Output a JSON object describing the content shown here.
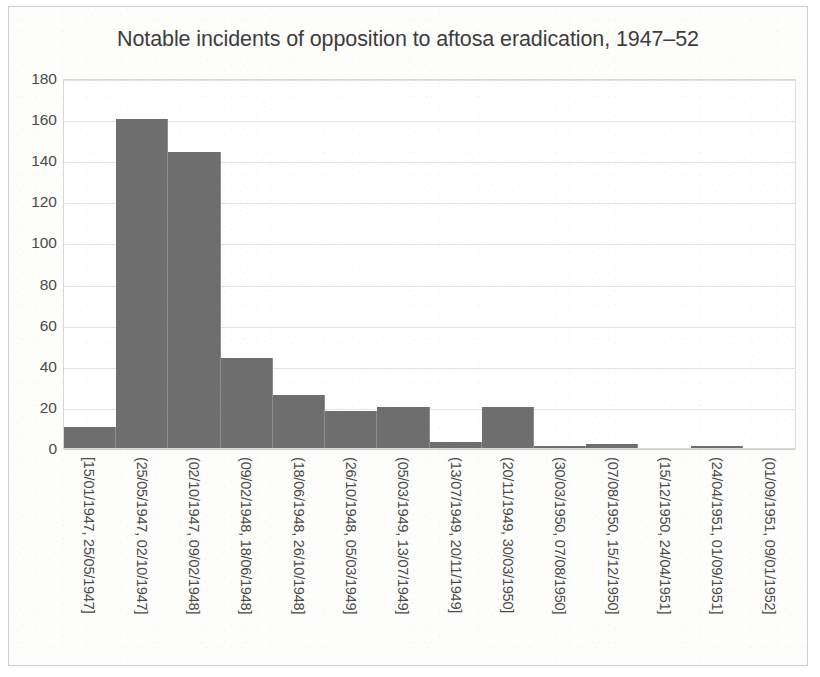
{
  "chart_data": {
    "type": "bar",
    "title": "Notable incidents of opposition to aftosa eradication, 1947–52",
    "subtitle": "",
    "xlabel": "",
    "ylabel": "",
    "ylim": [
      0,
      180
    ],
    "ytick_values": [
      0,
      20,
      40,
      60,
      80,
      100,
      120,
      140,
      160,
      180
    ],
    "ytick_labels": [
      "0",
      "20",
      "40",
      "60",
      "80",
      "100",
      "120",
      "140",
      "160",
      "180"
    ],
    "grid": true,
    "legend": false,
    "legend_position": "none",
    "bar_color": "#6e6e6e",
    "categories": [
      "[15/01/1947, 25/05/1947]",
      "(25/05/1947, 02/10/1947]",
      "(02/10/1947, 09/02/1948]",
      "(09/02/1948, 18/06/1948]",
      "(18/06/1948, 26/10/1948]",
      "(26/10/1948, 05/03/1949]",
      "(05/03/1949, 13/07/1949]",
      "(13/07/1949, 20/11/1949]",
      "(20/11/1949, 30/03/1950]",
      "(30/03/1950, 07/08/1950]",
      "(07/08/1950, 15/12/1950]",
      "(15/12/1950, 24/04/1951]",
      "(24/04/1951, 01/09/1951]",
      "(01/09/1951, 09/01/1952]"
    ],
    "values": [
      10,
      160,
      144,
      44,
      26,
      18,
      20,
      3,
      20,
      1,
      2,
      0,
      1,
      0
    ]
  }
}
